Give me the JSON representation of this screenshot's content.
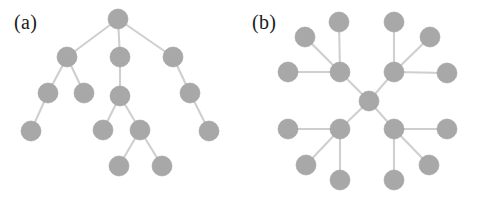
{
  "figure": {
    "background_color": "#ffffff",
    "node_color": "#a8a8a8",
    "edge_color": "#cfcfcf",
    "node_radius": 10,
    "edge_width": 2.1,
    "width": 477,
    "height": 201
  },
  "panels": [
    {
      "id": "panel-a",
      "label": "(a)",
      "label_position": {
        "x": 14,
        "y": 12
      },
      "caption_note": "hierarchical tree graph",
      "graph": {
        "type": "tree",
        "node_count": 14,
        "edge_count": 13,
        "nodes": [
          {
            "id": "a0",
            "name": "root",
            "x": 118,
            "y": 19,
            "depth": 0
          },
          {
            "id": "a1",
            "name": "level1-left",
            "x": 67,
            "y": 57,
            "depth": 1
          },
          {
            "id": "a2",
            "name": "level1-center",
            "x": 120,
            "y": 57,
            "depth": 1
          },
          {
            "id": "a3",
            "name": "level1-right",
            "x": 173,
            "y": 57,
            "depth": 1
          },
          {
            "id": "a4",
            "name": "level2-a",
            "x": 48,
            "y": 93,
            "depth": 2
          },
          {
            "id": "a5",
            "name": "level2-b",
            "x": 84,
            "y": 93,
            "depth": 2
          },
          {
            "id": "a6",
            "name": "level2-c",
            "x": 120,
            "y": 96,
            "depth": 2
          },
          {
            "id": "a7",
            "name": "level2-d",
            "x": 190,
            "y": 93,
            "depth": 2
          },
          {
            "id": "a8",
            "name": "level3-a",
            "x": 31,
            "y": 131,
            "depth": 3
          },
          {
            "id": "a9",
            "name": "level3-b",
            "x": 103,
            "y": 130,
            "depth": 3
          },
          {
            "id": "a10",
            "name": "level3-c",
            "x": 140,
            "y": 130,
            "depth": 3
          },
          {
            "id": "a11",
            "name": "level3-d",
            "x": 209,
            "y": 131,
            "depth": 3
          },
          {
            "id": "a12",
            "name": "level4-a",
            "x": 119,
            "y": 166,
            "depth": 4
          },
          {
            "id": "a13",
            "name": "level4-b",
            "x": 162,
            "y": 166,
            "depth": 4
          }
        ],
        "edges": [
          {
            "source": "a0",
            "target": "a1"
          },
          {
            "source": "a0",
            "target": "a2"
          },
          {
            "source": "a0",
            "target": "a3"
          },
          {
            "source": "a1",
            "target": "a4"
          },
          {
            "source": "a1",
            "target": "a5"
          },
          {
            "source": "a2",
            "target": "a6"
          },
          {
            "source": "a3",
            "target": "a7"
          },
          {
            "source": "a4",
            "target": "a8"
          },
          {
            "source": "a6",
            "target": "a9"
          },
          {
            "source": "a6",
            "target": "a10"
          },
          {
            "source": "a7",
            "target": "a11"
          },
          {
            "source": "a10",
            "target": "a12"
          },
          {
            "source": "a10",
            "target": "a13"
          }
        ]
      }
    },
    {
      "id": "panel-b",
      "label": "(b)",
      "label_position": {
        "x": 14,
        "y": 12
      },
      "caption_note": "radial hub-and-spoke graph",
      "graph": {
        "type": "radial",
        "node_count": 17,
        "edge_count": 16,
        "nodes": [
          {
            "id": "b0",
            "name": "center",
            "x": 131,
            "y": 101,
            "ring": 0
          },
          {
            "id": "b1",
            "name": "hub-upper-left",
            "x": 102,
            "y": 72,
            "ring": 1
          },
          {
            "id": "b2",
            "name": "hub-upper-right",
            "x": 156,
            "y": 72,
            "ring": 1
          },
          {
            "id": "b3",
            "name": "hub-lower-left",
            "x": 102,
            "y": 129,
            "ring": 1
          },
          {
            "id": "b4",
            "name": "hub-lower-right",
            "x": 156,
            "y": 129,
            "ring": 1
          },
          {
            "id": "b5",
            "name": "leaf-ul-top",
            "x": 101,
            "y": 22,
            "ring": 2
          },
          {
            "id": "b6",
            "name": "leaf-ul-diagonal",
            "x": 67,
            "y": 37,
            "ring": 2
          },
          {
            "id": "b7",
            "name": "leaf-ul-left",
            "x": 50,
            "y": 72,
            "ring": 2
          },
          {
            "id": "b8",
            "name": "leaf-ur-top",
            "x": 156,
            "y": 22,
            "ring": 2
          },
          {
            "id": "b9",
            "name": "leaf-ur-diagonal",
            "x": 192,
            "y": 37,
            "ring": 2
          },
          {
            "id": "b10",
            "name": "leaf-ur-right",
            "x": 209,
            "y": 73,
            "ring": 2
          },
          {
            "id": "b11",
            "name": "leaf-ll-left",
            "x": 50,
            "y": 129,
            "ring": 2
          },
          {
            "id": "b12",
            "name": "leaf-ll-diagonal",
            "x": 68,
            "y": 165,
            "ring": 2
          },
          {
            "id": "b13",
            "name": "leaf-ll-bottom",
            "x": 102,
            "y": 180,
            "ring": 2
          },
          {
            "id": "b14",
            "name": "leaf-lr-bottom",
            "x": 156,
            "y": 180,
            "ring": 2
          },
          {
            "id": "b15",
            "name": "leaf-lr-diagonal",
            "x": 191,
            "y": 165,
            "ring": 2
          },
          {
            "id": "b16",
            "name": "leaf-lr-right",
            "x": 209,
            "y": 129,
            "ring": 2
          }
        ],
        "edges": [
          {
            "source": "b0",
            "target": "b1"
          },
          {
            "source": "b0",
            "target": "b2"
          },
          {
            "source": "b0",
            "target": "b3"
          },
          {
            "source": "b0",
            "target": "b4"
          },
          {
            "source": "b1",
            "target": "b5"
          },
          {
            "source": "b1",
            "target": "b6"
          },
          {
            "source": "b1",
            "target": "b7"
          },
          {
            "source": "b2",
            "target": "b8"
          },
          {
            "source": "b2",
            "target": "b9"
          },
          {
            "source": "b2",
            "target": "b10"
          },
          {
            "source": "b3",
            "target": "b11"
          },
          {
            "source": "b3",
            "target": "b12"
          },
          {
            "source": "b3",
            "target": "b13"
          },
          {
            "source": "b4",
            "target": "b14"
          },
          {
            "source": "b4",
            "target": "b15"
          },
          {
            "source": "b4",
            "target": "b16"
          }
        ]
      }
    }
  ]
}
